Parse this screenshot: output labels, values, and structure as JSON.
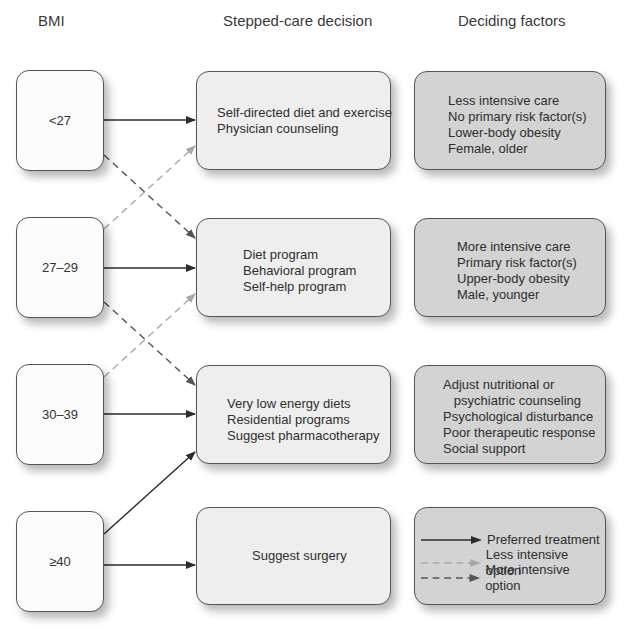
{
  "headers": {
    "bmi": "BMI",
    "decision": "Stepped-care decision",
    "factors": "Deciding factors"
  },
  "bmi_levels": [
    {
      "label": "<27"
    },
    {
      "label": "27–29"
    },
    {
      "label": "30–39"
    },
    {
      "label": "≥40"
    }
  ],
  "decisions": [
    {
      "lines": [
        "Self-directed diet and exercise",
        "Physician counseling"
      ]
    },
    {
      "lines": [
        "Diet program",
        "Behavioral program",
        "Self-help program"
      ]
    },
    {
      "lines": [
        "Very low energy diets",
        "Residential programs",
        "Suggest pharmacotherapy"
      ]
    },
    {
      "lines": [
        "Suggest surgery"
      ]
    }
  ],
  "factors": [
    {
      "lines": [
        "Less intensive care",
        "No primary risk factor(s)",
        "Lower-body obesity",
        "Female, older"
      ]
    },
    {
      "lines": [
        "More intensive care",
        "Primary risk factor(s)",
        "Upper-body obesity",
        "Male, younger"
      ]
    },
    {
      "lines": [
        "Adjust nutritional or",
        "   psychiatric counseling",
        "Psychological disturbance",
        "Poor therapeutic response",
        "Social support"
      ]
    }
  ],
  "legend": {
    "preferred": "Preferred treatment",
    "less": "Less intensive option",
    "more": "More intensive option"
  },
  "colors": {
    "preferred_arrow": "#2b2b2b",
    "less_intensive_arrow": "#a8a8a8",
    "more_intensive_arrow": "#555555",
    "bmi_box": "#fbfbfb",
    "decision_box": "#eeeeee",
    "factor_box": "#d3d3d3"
  }
}
